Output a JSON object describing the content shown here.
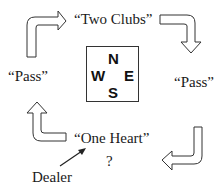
{
  "diagram": {
    "bids": {
      "north": "“Two Clubs”",
      "east": "“Pass”",
      "south": "“One Heart”",
      "west": "“Pass”",
      "next": "?"
    },
    "compass": {
      "n": "N",
      "e": "E",
      "s": "S",
      "w": "W"
    },
    "dealer_label": "Dealer",
    "arrows": [
      "arrow-west-to-north",
      "arrow-north-to-east",
      "arrow-east-to-south",
      "arrow-south-to-west"
    ],
    "colors": {
      "stroke": "#333333",
      "text": "#1a1a1a",
      "background": "#ffffff"
    }
  }
}
